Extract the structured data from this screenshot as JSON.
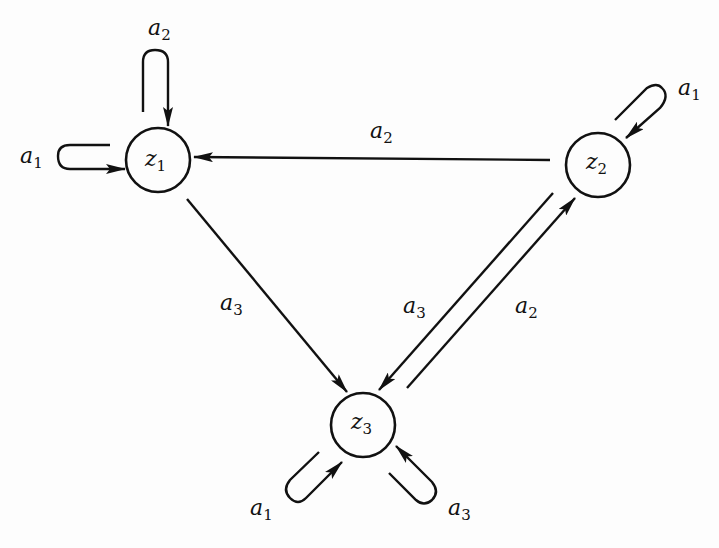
{
  "diagram": {
    "type": "state-transition-graph",
    "colors": {
      "ink": "#111111",
      "background": "#fdfdfd"
    },
    "nodes": [
      {
        "id": "z1",
        "base": "z",
        "sub": "1",
        "cx": 158,
        "cy": 160,
        "r": 32
      },
      {
        "id": "z2",
        "base": "z",
        "sub": "2",
        "cx": 598,
        "cy": 165,
        "r": 32
      },
      {
        "id": "z3",
        "base": "z",
        "sub": "3",
        "cx": 363,
        "cy": 425,
        "r": 32
      }
    ],
    "edges": [
      {
        "from": "z1",
        "to": "z1",
        "base": "a",
        "sub": "2",
        "kind": "self-loop-top"
      },
      {
        "from": "z1",
        "to": "z1",
        "base": "a",
        "sub": "1",
        "kind": "self-loop-left"
      },
      {
        "from": "z2",
        "to": "z2",
        "base": "a",
        "sub": "1",
        "kind": "self-loop-top-right"
      },
      {
        "from": "z3",
        "to": "z3",
        "base": "a",
        "sub": "1",
        "kind": "self-loop-bottom-left"
      },
      {
        "from": "z3",
        "to": "z3",
        "base": "a",
        "sub": "3",
        "kind": "self-loop-bottom-right"
      },
      {
        "from": "z2",
        "to": "z1",
        "base": "a",
        "sub": "2",
        "kind": "straight"
      },
      {
        "from": "z1",
        "to": "z3",
        "base": "a",
        "sub": "3",
        "kind": "straight"
      },
      {
        "from": "z2",
        "to": "z3",
        "base": "a",
        "sub": "3",
        "kind": "straight"
      },
      {
        "from": "z3",
        "to": "z2",
        "base": "a",
        "sub": "2",
        "kind": "straight"
      }
    ]
  }
}
